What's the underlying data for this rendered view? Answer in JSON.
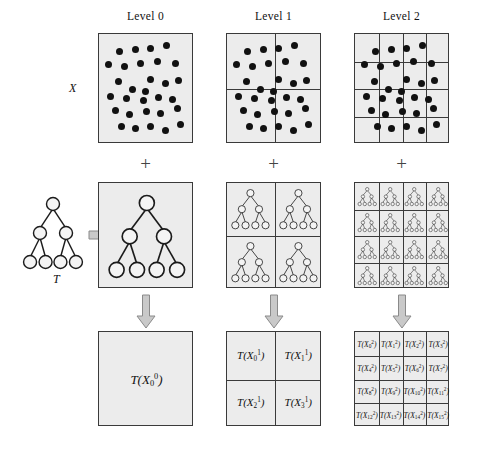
{
  "figure": {
    "background_color": "#ffffff",
    "panel_fill": "#ececec",
    "panel_border_color": "#3a3a3a",
    "dot_color": "#111111",
    "arrow_color": "#c9c9c9",
    "arrow_border_color": "#8a8a8a"
  },
  "columns": [
    {
      "id": "level0",
      "header": "Level 0",
      "divisions": 1,
      "cells": 1
    },
    {
      "id": "level1",
      "header": "Level 1",
      "divisions": 2,
      "cells": 4
    },
    {
      "id": "level2",
      "header": "Level 2",
      "divisions": 4,
      "cells": 16
    }
  ],
  "row_labels": {
    "data": "X",
    "tree": "T"
  },
  "operators": {
    "plus": "+",
    "arrow_down": "arrow-down",
    "arrow_right": "arrow-right"
  },
  "source_tree": {
    "label": "T",
    "levels": 3,
    "nodes_per_level": [
      1,
      2,
      4
    ],
    "total_nodes": 7
  },
  "point_cloud": {
    "count": 30,
    "points_level0": [
      [
        0.18,
        0.12
      ],
      [
        0.37,
        0.1
      ],
      [
        0.55,
        0.09
      ],
      [
        0.74,
        0.06
      ],
      [
        0.05,
        0.25
      ],
      [
        0.24,
        0.27
      ],
      [
        0.43,
        0.24
      ],
      [
        0.63,
        0.22
      ],
      [
        0.84,
        0.24
      ],
      [
        0.17,
        0.42
      ],
      [
        0.55,
        0.4
      ],
      [
        0.72,
        0.44
      ],
      [
        0.88,
        0.41
      ],
      [
        0.33,
        0.5
      ],
      [
        0.49,
        0.53
      ],
      [
        0.08,
        0.58
      ],
      [
        0.26,
        0.6
      ],
      [
        0.46,
        0.62
      ],
      [
        0.64,
        0.59
      ],
      [
        0.81,
        0.61
      ],
      [
        0.14,
        0.72
      ],
      [
        0.3,
        0.76
      ],
      [
        0.5,
        0.73
      ],
      [
        0.67,
        0.75
      ],
      [
        0.86,
        0.7
      ],
      [
        0.2,
        0.88
      ],
      [
        0.37,
        0.9
      ],
      [
        0.55,
        0.88
      ],
      [
        0.72,
        0.92
      ],
      [
        0.9,
        0.86
      ]
    ]
  },
  "subtrees": {
    "level0": {
      "count": 1,
      "nodes_per_level": [
        1,
        2,
        4
      ]
    },
    "level1": {
      "count": 4,
      "nodes_per_level": [
        1,
        2,
        4
      ]
    },
    "level2": {
      "count": 16,
      "nodes_per_level": [
        1,
        2,
        4
      ]
    }
  },
  "output_labels": {
    "level0": [
      {
        "fn": "T",
        "var": "X",
        "sub": "0",
        "sup": "0"
      }
    ],
    "level1": [
      {
        "fn": "T",
        "var": "X",
        "sub": "0",
        "sup": "1"
      },
      {
        "fn": "T",
        "var": "X",
        "sub": "1",
        "sup": "1"
      },
      {
        "fn": "T",
        "var": "X",
        "sub": "2",
        "sup": "1"
      },
      {
        "fn": "T",
        "var": "X",
        "sub": "3",
        "sup": "1"
      }
    ],
    "level2": [
      {
        "fn": "T",
        "var": "X",
        "sub": "0",
        "sup": "2"
      },
      {
        "fn": "T",
        "var": "X",
        "sub": "1",
        "sup": "2"
      },
      {
        "fn": "T",
        "var": "X",
        "sub": "2",
        "sup": "2"
      },
      {
        "fn": "T",
        "var": "X",
        "sub": "3",
        "sup": "2"
      },
      {
        "fn": "T",
        "var": "X",
        "sub": "4",
        "sup": "2"
      },
      {
        "fn": "T",
        "var": "X",
        "sub": "5",
        "sup": "2"
      },
      {
        "fn": "T",
        "var": "X",
        "sub": "6",
        "sup": "2"
      },
      {
        "fn": "T",
        "var": "X",
        "sub": "7",
        "sup": "2"
      },
      {
        "fn": "T",
        "var": "X",
        "sub": "8",
        "sup": "2"
      },
      {
        "fn": "T",
        "var": "X",
        "sub": "9",
        "sup": "2"
      },
      {
        "fn": "T",
        "var": "X",
        "sub": "10",
        "sup": "2"
      },
      {
        "fn": "T",
        "var": "X",
        "sub": "11",
        "sup": "2"
      },
      {
        "fn": "T",
        "var": "X",
        "sub": "12",
        "sup": "2"
      },
      {
        "fn": "T",
        "var": "X",
        "sub": "13",
        "sup": "2"
      },
      {
        "fn": "T",
        "var": "X",
        "sub": "14",
        "sup": "2"
      },
      {
        "fn": "T",
        "var": "X",
        "sub": "15",
        "sup": "2"
      }
    ]
  }
}
